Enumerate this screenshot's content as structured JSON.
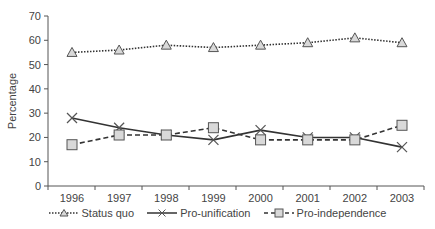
{
  "chart_data": {
    "type": "line",
    "title": "",
    "xlabel": "",
    "ylabel": "Percentage",
    "ylim": [
      0,
      70
    ],
    "yticks": [
      0,
      10,
      20,
      30,
      40,
      50,
      60,
      70
    ],
    "grid": false,
    "legend_position": "bottom",
    "categories": [
      "1996",
      "1997",
      "1998",
      "1999",
      "2000",
      "2001",
      "2002",
      "2003"
    ],
    "series": [
      {
        "name": "Status quo",
        "marker": "triangle",
        "line_style": "dotted",
        "values": [
          55,
          56,
          58,
          57,
          58,
          59,
          61,
          59
        ]
      },
      {
        "name": "Pro-unification",
        "marker": "x",
        "line_style": "solid",
        "values": [
          28,
          24,
          21,
          19,
          23,
          20,
          20,
          16
        ]
      },
      {
        "name": "Pro-independence",
        "marker": "square",
        "line_style": "dashed",
        "values": [
          17,
          21,
          21,
          24,
          19,
          19,
          19,
          25
        ]
      }
    ]
  },
  "legend": {
    "status_quo": "Status quo",
    "pro_unification": "Pro-unification",
    "pro_independence": "Pro-independence"
  },
  "axis": {
    "y_title": "Percentage"
  },
  "colors": {
    "line": "#333333",
    "marker_fill": "#d9d9d9",
    "axis": "#555555"
  }
}
